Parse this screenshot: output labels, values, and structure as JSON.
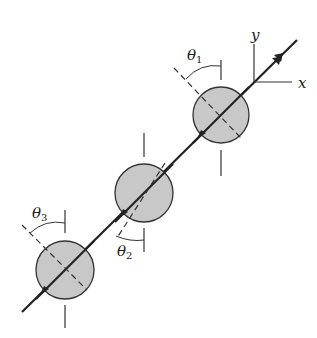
{
  "figure": {
    "type": "diagram",
    "colors": {
      "background": "#ffffff",
      "disk_fill": "#c8c8c8",
      "stroke": "#222222"
    },
    "axes": {
      "x_label": "x",
      "y_label": "y"
    },
    "angles": [
      {
        "symbol": "θ",
        "subscript": "1"
      },
      {
        "symbol": "θ",
        "subscript": "2"
      },
      {
        "symbol": "θ",
        "subscript": "3"
      }
    ],
    "disks": [
      {
        "name": "disk-1",
        "cx": 221,
        "cy": 115,
        "r": 28
      },
      {
        "name": "disk-2",
        "cx": 144,
        "cy": 193,
        "r": 29
      },
      {
        "name": "disk-3",
        "cx": 65,
        "cy": 270,
        "r": 29
      }
    ]
  }
}
